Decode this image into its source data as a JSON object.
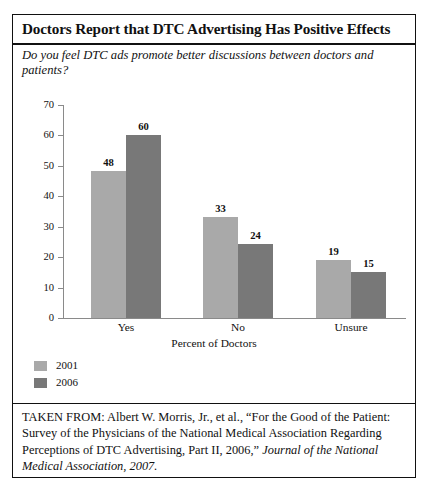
{
  "figure": {
    "title": "Doctors Report that DTC Advertising  Has Positive Effects",
    "subtitle": "Do you feel DTC ads promote better discussions between doctors and patients?",
    "citation_prefix": "TAKEN FROM: Albert W. Morris, Jr., et al., “For the Good of the Patient: Survey of the Physicians of the National Medical Association Regarding Perceptions of DTC Advertising, Part II, 2006,” ",
    "citation_italic": "Journal of the National Medical Association, 2007."
  },
  "colors": {
    "series_2001": "#a9a9a9",
    "series_2006": "#787878",
    "axis": "#8a8a8a",
    "text": "#111111",
    "border": "#111111",
    "background": "#ffffff"
  },
  "chart_data": {
    "type": "bar",
    "title": "Doctors Report that DTC Advertising  Has Positive Effects",
    "subtitle": "Do you feel DTC ads promote better discussions between doctors and patients?",
    "categories": [
      "Yes",
      "No",
      "Unsure"
    ],
    "series": [
      {
        "name": "2001",
        "color": "#a9a9a9",
        "values": [
          48,
          33,
          19
        ]
      },
      {
        "name": "2006",
        "color": "#787878",
        "values": [
          60,
          24,
          15
        ]
      }
    ],
    "xlabel": "Percent of Doctors",
    "ylabel": "",
    "ylim": [
      0,
      70
    ],
    "yticks": [
      0,
      10,
      20,
      30,
      40,
      50,
      60,
      70
    ],
    "ytick_labels": [
      "0",
      "10",
      "20",
      "30",
      "40",
      "50",
      "60",
      "70"
    ],
    "grid": false,
    "legend_position": "below-left",
    "data_labels": true
  }
}
